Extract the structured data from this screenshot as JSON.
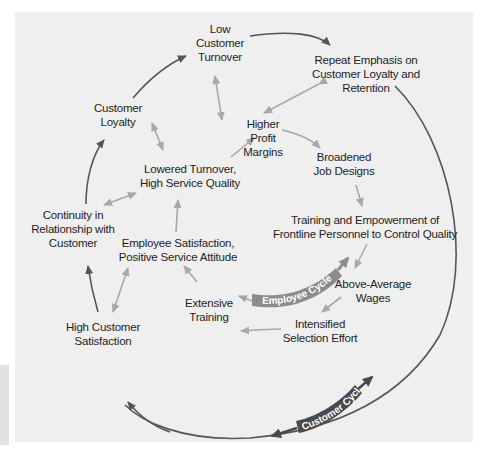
{
  "diagram": {
    "type": "cycle-diagram",
    "colors": {
      "panel_bg": "#efefef",
      "page_bg": "#ffffff",
      "outer_arrow": "#555555",
      "inner_arrow": "#a8a8a8",
      "cycle_band_employee": "#8c8c8c",
      "cycle_band_customer": "#4a4a4a",
      "text": "#1e1e1e"
    },
    "nodes": {
      "low_customer_turnover": [
        "Low",
        "Customer",
        "Turnover"
      ],
      "repeat_emphasis": [
        "Repeat Emphasis on",
        "Customer Loyalty and",
        "Retention"
      ],
      "customer_loyalty": [
        "Customer",
        "Loyalty"
      ],
      "higher_profit_margins": [
        "Higher",
        "Profit",
        "Margins"
      ],
      "broadened_job_designs": [
        "Broadened",
        "Job Designs"
      ],
      "lowered_turnover": [
        "Lowered Turnover,",
        "High Service Quality"
      ],
      "continuity": [
        "Continuity in",
        "Relationship with",
        "Customer"
      ],
      "training_empowerment": [
        "Training and Empowerment of",
        "Frontline Personnel to Control Quality"
      ],
      "employee_satisfaction": [
        "Employee Satisfaction,",
        "Positive Service Attitude"
      ],
      "above_average_wages": [
        "Above-Average",
        "Wages"
      ],
      "extensive_training": [
        "Extensive",
        "Training"
      ],
      "intensified_selection": [
        "Intensified",
        "Selection Effort"
      ],
      "high_customer_satisfaction": [
        "High Customer",
        "Satisfaction"
      ]
    },
    "cycle_labels": {
      "employee": "Employee Cycle",
      "customer": "Customer Cycle"
    }
  }
}
